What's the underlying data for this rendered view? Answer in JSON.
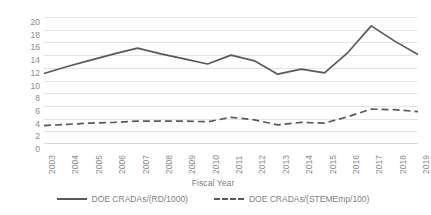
{
  "chart_data": {
    "type": "line",
    "title": "",
    "xlabel": "Fiscal Year",
    "ylabel": "DOE CRADAs Metrics",
    "categories": [
      "2003",
      "2004",
      "2005",
      "2006",
      "2007",
      "2008",
      "2009",
      "2010",
      "2011",
      "2012",
      "2013",
      "2014",
      "2015",
      "2016",
      "2017",
      "2018",
      "2019"
    ],
    "ylim": [
      0,
      20
    ],
    "yticks": [
      20,
      18,
      16,
      14,
      12,
      10,
      8,
      6,
      4,
      2,
      0
    ],
    "grid": true,
    "legend_position": "bottom",
    "series": [
      {
        "name": "DOE CRADAs/(RD/1000)",
        "style": "solid",
        "color": "#595959",
        "values": [
          11.1,
          12.2,
          13.2,
          14.2,
          15.1,
          14.2,
          13.4,
          12.6,
          14.0,
          13.1,
          11.0,
          11.8,
          11.2,
          14.4,
          18.6,
          16.2,
          14.1
        ]
      },
      {
        "name": "DOE CRADAs/(STEMEmp/100)",
        "style": "dashed",
        "color": "#595959",
        "values": [
          2.9,
          3.1,
          3.3,
          3.4,
          3.6,
          3.6,
          3.6,
          3.5,
          4.2,
          3.8,
          3.0,
          3.4,
          3.3,
          4.3,
          5.5,
          5.4,
          5.1
        ]
      }
    ]
  },
  "axes": {
    "y_title": "DOE CRADAs Metrics",
    "x_title": "Fiscal Year"
  },
  "legend": {
    "items": [
      {
        "label": "DOE CRADAs/(RD/1000)",
        "style": "solid"
      },
      {
        "label": "DOE CRADAs/(STEMEmp/100)",
        "style": "dashed"
      }
    ]
  }
}
